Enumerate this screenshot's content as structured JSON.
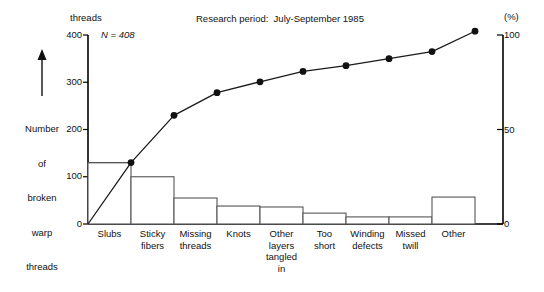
{
  "chart_data": {
    "type": "bar",
    "title": "Research period:  July-September 1985",
    "subtitle": "",
    "annotation": "N = 408",
    "unit_header": "threads",
    "ylabel": "Number\nof\nbroken\nwarp\nthreads",
    "ylabel_lines": [
      "Number",
      "of",
      "broken",
      "warp",
      "threads"
    ],
    "xlabel": "",
    "y2label": "(%)",
    "ylim": [
      0,
      400
    ],
    "y2lim": [
      0,
      100
    ],
    "yticks": [
      0,
      100,
      200,
      300,
      400
    ],
    "ytick_labels": [
      "0",
      "100",
      "200",
      "300",
      "400"
    ],
    "y2ticks": [
      0,
      50,
      100
    ],
    "y2tick_labels": [
      "0",
      "50",
      "100"
    ],
    "grid": false,
    "legend": "none",
    "categories": [
      "Slubs",
      "Sticky\nfibers",
      "Missing\nthreads",
      "Knots",
      "Other\nlayers\ntangled\nin",
      "Too\nshort",
      "Winding\ndefects",
      "Missed\ntwill",
      "Other"
    ],
    "category_lines": [
      [
        "Slubs"
      ],
      [
        "Sticky",
        "fibers"
      ],
      [
        "Missing",
        "threads"
      ],
      [
        "Knots"
      ],
      [
        "Other",
        "layers",
        "tangled",
        "in"
      ],
      [
        "Too",
        "short"
      ],
      [
        "Winding",
        "defects"
      ],
      [
        "Missed",
        "twill"
      ],
      [
        "Other"
      ]
    ],
    "values": [
      130,
      100,
      55,
      38,
      36,
      23,
      15,
      15,
      57
    ],
    "cumulative": [
      130,
      230,
      285,
      323,
      359,
      382,
      397,
      412,
      408
    ],
    "cumulative_points": [
      130,
      230,
      278,
      301,
      323,
      335,
      350,
      365,
      408
    ],
    "cumulative_percent": [
      32,
      56,
      68,
      74,
      79,
      82,
      86,
      89,
      100
    ],
    "bar_fill": "#ffffff",
    "bar_stroke": "#555555",
    "line_color": "#1a1a1a",
    "marker_color": "#111111",
    "axis_color": "#000000"
  },
  "notes": {
    "first_bar_guide": "130"
  }
}
